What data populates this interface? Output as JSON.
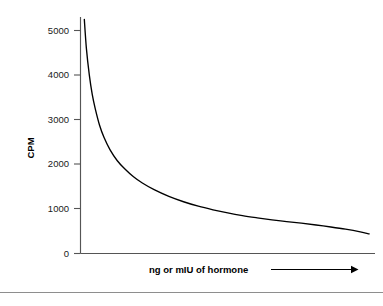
{
  "chart_data": {
    "type": "line",
    "title": "",
    "subtitle": "",
    "xlabel": "ng or mIU of hormone",
    "ylabel": "CPM",
    "xlabel_arrow": "→",
    "grid": false,
    "legend": null,
    "legend_position": "none",
    "xlim": [
      0,
      100
    ],
    "ylim": [
      0,
      5500
    ],
    "x_ticks": [],
    "x_tick_labels": [],
    "y_ticks": [
      0,
      1000,
      2000,
      3000,
      4000,
      5000
    ],
    "y_tick_labels": [
      "0",
      "1000",
      "2000",
      "3000",
      "4000",
      "5000"
    ],
    "annotations": [],
    "series": [
      {
        "name": "standard curve",
        "color": "#000000",
        "x": [
          1.3,
          2.0,
          3.0,
          4.0,
          5.0,
          6.5,
          8.0,
          10.0,
          12.5,
          15.0,
          18.0,
          21.0,
          25.0,
          30.0,
          35.0,
          40.0,
          45.0,
          50.0,
          55.0,
          60.0,
          65.0,
          70.0,
          75.0,
          80.0,
          85.0,
          90.0,
          95.0,
          98.0
        ],
        "y": [
          5250,
          4600,
          4000,
          3560,
          3250,
          2870,
          2600,
          2330,
          2080,
          1900,
          1720,
          1580,
          1430,
          1280,
          1160,
          1060,
          980,
          910,
          850,
          800,
          755,
          715,
          680,
          640,
          595,
          545,
          485,
          440
        ]
      }
    ]
  },
  "figure": {
    "y_axis_title": "CPM",
    "x_axis_title": "ng or mIU of hormone",
    "y_tick_labels": [
      "5000",
      "4000",
      "3000",
      "2000",
      "1000",
      "0"
    ],
    "curve_color": "#000000",
    "axis_color": "#555555",
    "text_color": "#1a1a1a",
    "background_color": "#ffffff",
    "footer_rule_color": "#8e8e8e"
  }
}
